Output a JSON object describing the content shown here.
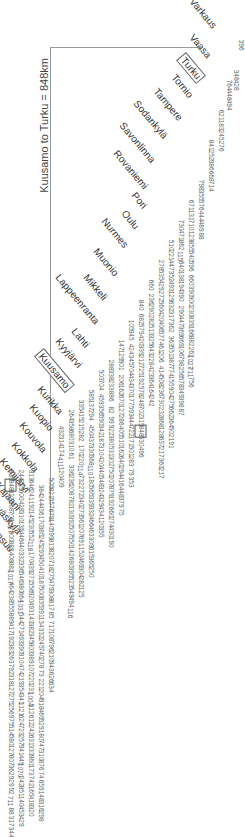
{
  "title": "Kuusamo to Turku = 848km",
  "cities": [
    {
      "name": "Varkaus",
      "x": 196,
      "y": -4,
      "boxed": false
    },
    {
      "name": "Vaasa",
      "x": 196,
      "y": 32,
      "boxed": false
    },
    {
      "name": "Turku",
      "x": 186,
      "y": 52,
      "boxed": true
    },
    {
      "name": "Tornio",
      "x": 178,
      "y": 72,
      "boxed": false
    },
    {
      "name": "Tampere",
      "x": 160,
      "y": 86,
      "boxed": false
    },
    {
      "name": "Sodankylä",
      "x": 140,
      "y": 98,
      "boxed": false
    },
    {
      "name": "Savonlinna",
      "x": 126,
      "y": 120,
      "boxed": false
    },
    {
      "name": "Rovaniemi",
      "x": 120,
      "y": 148,
      "boxed": false
    },
    {
      "name": "Pori",
      "x": 138,
      "y": 190,
      "boxed": false
    },
    {
      "name": "Oulu",
      "x": 128,
      "y": 208,
      "boxed": false
    },
    {
      "name": "Nurmes",
      "x": 108,
      "y": 216,
      "boxed": false
    },
    {
      "name": "Muonio",
      "x": 100,
      "y": 246,
      "boxed": false
    },
    {
      "name": "Mikkeli",
      "x": 90,
      "y": 272,
      "boxed": false
    },
    {
      "name": "Lappeenranta",
      "x": 62,
      "y": 272,
      "boxed": false
    },
    {
      "name": "Lahti",
      "x": 78,
      "y": 326,
      "boxed": false
    },
    {
      "name": "Kyyjärvi",
      "x": 62,
      "y": 336,
      "boxed": false
    },
    {
      "name": "Kuusamo",
      "x": 44,
      "y": 348,
      "boxed": true
    },
    {
      "name": "Kurikka",
      "x": 44,
      "y": 384,
      "boxed": false
    },
    {
      "name": "Kuopio",
      "x": 36,
      "y": 402,
      "boxed": false
    },
    {
      "name": "Kouvola",
      "x": 26,
      "y": 420,
      "boxed": false
    },
    {
      "name": "Kokkola",
      "x": 18,
      "y": 440,
      "boxed": false
    },
    {
      "name": "Kemijärvi",
      "x": 6,
      "y": 456,
      "boxed": false
    },
    {
      "name": "Kajaani",
      "x": 2,
      "y": 480,
      "boxed": false
    },
    {
      "name": "Jyväskylä",
      "x": -4,
      "y": 496,
      "boxed": false
    },
    {
      "name": "Joensuu",
      "x": -8,
      "y": 518,
      "boxed": false
    }
  ],
  "columns": [
    {
      "x": 8,
      "y": 466,
      "shade": false,
      "values": [
        "839",
        "848",
        "623",
        "268",
        "709",
        "1037",
        "800",
        "882",
        "408",
        "882",
        "1017",
        "464",
        "238",
        "555",
        "889",
        "417",
        "192",
        "383",
        "263",
        "792",
        "318",
        "127",
        "275",
        "256",
        "975",
        "514",
        "580",
        "127",
        "807",
        "362",
        "929",
        "92",
        "711",
        "88",
        "317",
        "344"
      ]
    },
    {
      "x": 18,
      "y": 466,
      "shade": false,
      "values": [
        "244",
        "229",
        "600",
        "428",
        "310",
        "135",
        "446",
        "440",
        "332",
        "336",
        "546",
        "380",
        "664",
        "1031",
        "544",
        "271",
        "493",
        "390",
        "910",
        "474",
        "219",
        "354",
        "341",
        "1121",
        "624",
        "723",
        "257",
        "941",
        "449",
        "1070",
        "242",
        "851",
        "140",
        "453",
        "429"
      ]
    },
    {
      "x": 28,
      "y": 466,
      "shade": false,
      "values": [
        "313",
        "646",
        "241",
        "192",
        "145",
        "230",
        "552",
        "118",
        "170",
        "439",
        "271",
        "556",
        "920",
        "493",
        "143",
        "382",
        "345",
        "803",
        "389",
        "107",
        "220",
        "231",
        "1004",
        "512",
        "612",
        "242",
        "631",
        "333",
        "960",
        "173",
        "742",
        "165",
        "418",
        "320"
      ]
    },
    {
      "x": 38,
      "y": 466,
      "shade": false,
      "values": [
        "384",
        "244",
        "436",
        "170",
        "385",
        "245",
        "293",
        "450",
        "410",
        "187",
        "500",
        "835",
        "391",
        "134",
        "332",
        "245",
        "740",
        "278",
        "73",
        "221",
        "204",
        "918",
        "469",
        "529",
        "180",
        "747",
        "310",
        "876",
        "74",
        "659",
        "148",
        "316",
        "298"
      ]
    }
  ],
  "shaded_columns": [
    {
      "x": 14,
      "width": 9,
      "note": "shade band"
    },
    {
      "x": 64,
      "width": 9
    },
    {
      "x": 110,
      "width": 9
    },
    {
      "x": 158,
      "width": 9
    },
    {
      "x": 198,
      "width": 9
    },
    {
      "x": 226,
      "width": 9
    }
  ],
  "strips": [
    {
      "x": 10,
      "y": 470,
      "text": "839 848 623 268 709 1037 800 882 408 882 1017 464 238 555 889 417 192 383 263 792 318 127 275 256 975 514 580 127 807 362 929 92 711 88 317 344"
    },
    {
      "x": 20,
      "y": 470,
      "text": "244 229 600 428 310 135 446 440 332 336 546 380 664 1031 544 271 493 390 910 474 219 354 341 1121 624 723 257 941 449 1070 242 851 140 453 429"
    },
    {
      "x": 30,
      "y": 470,
      "text": "313 646 241 192 145 230 552 118 170 439 271 556 920 493 143 382 345 803 389 107 220 231 1004 512 612 242 631 333 960 173 742 165 418 320"
    },
    {
      "x": 40,
      "y": 485,
      "text": "384 244 436 170 385 245 293 450 410 187 500 835 391 134 332 245 740 278 73 221 204 918 469 529 180 747 310 876 74 659 148 316 298"
    },
    {
      "x": 50,
      "y": 478,
      "text": "505 821 557 679 140 599 813 820 718 275 479 308 817 85 717 108 796 210 943 626 634"
    },
    {
      "x": 60,
      "y": 426,
      "text": "432 314 174 411 120 409"
    },
    {
      "x": 70,
      "y": 410,
      "text": "264 358 680 310 61 ; 336 236 208 782 130 392 507 550 142 680 395 523 549 494 116"
    },
    {
      "x": 80,
      "y": 400,
      "text": "335 415 215 282 ; 170 220 114 732 272 340 273 561 207 691 152 469 304 282 125"
    },
    {
      "x": 90,
      "y": 390,
      "text": "585 137 294 ; 450 437 330 568 110 180 565 339 332 466 463 309 615 365 250"
    },
    {
      "x": 100,
      "y": 370,
      "text": "503 704 ; 459 356 590 342 187 310 420 440 548 324 329 434 120 355"
    },
    {
      "x": 110,
      "y": 360,
      "text": "288 338 233 886 ; 82 99 922 380 531 302 750 207 879 192 660 274 430 190"
    },
    {
      "x": 120,
      "y": 340,
      "text": "147 129 901 ; 206 162 670 127 286 405 510 162 640 294 416 448 379 75"
    },
    {
      "x": 130,
      "y": 320,
      "text": "105 945 ; 424 345 704 434 370 177 593 444 722 171 501 283 79 353"
    },
    {
      "x": 140,
      "y": 300,
      "text": "840 ; 682 579 420 339 212 725 192 578 248 702 315 848 530 496"
    },
    {
      "x": 150,
      "y": 280,
      "text": "660 ; 236 290 282 513 325 643 228 423 364 164 242"
    },
    {
      "x": 160,
      "y": 260,
      "text": "278 535 429 272 560 420 406 577 461 206 ; 414 508 236 730 232 868 128 637 217 363 217"
    },
    {
      "x": 170,
      "y": 240,
      "text": "510 221 447 352 493 129 632 317 362 ; 363 551 387 774 155 904 275 662 364 502 191"
    },
    {
      "x": 180,
      "y": 220,
      "text": "730 471 862 115 640 138 194 390 ; 290 447 369 669 106 798 256 578 349 398 87"
    },
    {
      "x": 190,
      "y": 200,
      "text": "671 131 710 123 855 540 596 ; 660 390 900 230 839 166 882 262 1027 711 756"
    },
    {
      "x": 200,
      "y": 180,
      "text": "798 355 576 444 489 88"
    },
    {
      "x": 210,
      "y": 140,
      "text": "841 252 986 668 714"
    },
    {
      "x": 220,
      "y": 110,
      "text": "621 183 245 276"
    },
    {
      "x": 228,
      "y": 80,
      "text": "764 448 494"
    },
    {
      "x": 235,
      "y": 70,
      "text": "346 428"
    },
    {
      "x": 240,
      "y": 40,
      "text": "396"
    }
  ]
}
